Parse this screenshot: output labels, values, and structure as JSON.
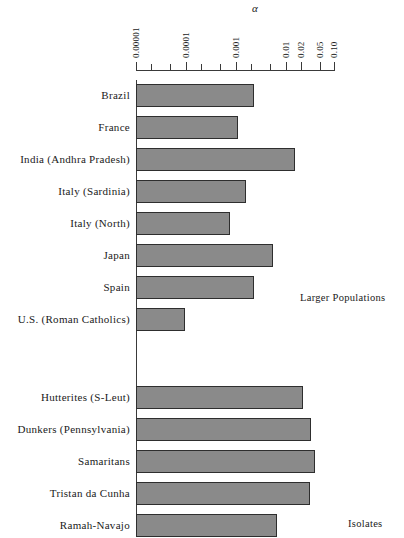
{
  "chart_data": {
    "type": "bar",
    "orientation": "horizontal",
    "title": "",
    "xlabel": "α",
    "ylabel": "",
    "xscale": "log",
    "xlim": [
      1e-05,
      0.1
    ],
    "grid": false,
    "legend_position": "none",
    "axis_symbol": "α",
    "tick_labels": [
      "0.00001",
      "0.0001",
      "0.001",
      "0.01",
      "0.02",
      "0.05",
      "0.10"
    ],
    "tick_values": [
      1e-05,
      0.0001,
      0.001,
      0.01,
      0.02,
      0.05,
      0.1
    ],
    "minor_tick_values": [
      2e-05,
      5e-05,
      0.0002,
      0.0005,
      0.002,
      0.005
    ],
    "categories": [
      "Brazil",
      "France",
      "India (Andhra Pradesh)",
      "Italy (Sardinia)",
      "Italy (North)",
      "Japan",
      "Spain",
      "U.S. (Roman Catholics)",
      "Hutterites (S-Leut)",
      "Dunkers (Pennsylvania)",
      "Samaritans",
      "Tristan da Cunha",
      "Ramah-Navajo"
    ],
    "values": [
      0.0023,
      0.0011,
      0.015,
      0.0016,
      0.00076,
      0.0055,
      0.0023,
      0.0001,
      0.022,
      0.032,
      0.038,
      0.03,
      0.0066
    ],
    "groups": [
      {
        "label": "Larger Populations",
        "categories": [
          "Brazil",
          "France",
          "India (Andhra Pradesh)",
          "Italy (Sardinia)",
          "Italy (North)",
          "Japan",
          "Spain",
          "U.S. (Roman Catholics)"
        ]
      },
      {
        "label": "Isolates",
        "categories": [
          "Hutterites (S-Leut)",
          "Dunkers (Pennsylvania)",
          "Samaritans",
          "Tristan da Cunha",
          "Ramah-Navajo"
        ]
      }
    ],
    "colors": {
      "bar_fill": "#8a8a8a",
      "bar_stroke": "#2e2e2e",
      "axis": "#3a3a3a",
      "text": "#1a1a1a",
      "background": "#ffffff"
    }
  },
  "rows": [
    {
      "label": "Brazil",
      "value": 0.0023,
      "bar_px": 118
    },
    {
      "label": "France",
      "value": 0.0011,
      "bar_px": 102
    },
    {
      "label": "India (Andhra Pradesh)",
      "value": 0.015,
      "bar_px": 159
    },
    {
      "label": "Italy (Sardinia)",
      "value": 0.0016,
      "bar_px": 110
    },
    {
      "label": "Italy (North)",
      "value": 0.00076,
      "bar_px": 94
    },
    {
      "label": "Japan",
      "value": 0.0055,
      "bar_px": 137
    },
    {
      "label": "Spain",
      "value": 0.0023,
      "bar_px": 118
    },
    {
      "label": "U.S. (Roman Catholics)",
      "value": 0.0001,
      "bar_px": 49
    },
    {
      "label": "Hutterites (S-Leut)",
      "value": 0.022,
      "bar_px": 167
    },
    {
      "label": "Dunkers (Pennsylvania)",
      "value": 0.032,
      "bar_px": 175
    },
    {
      "label": "Samaritans",
      "value": 0.038,
      "bar_px": 179
    },
    {
      "label": "Tristan da Cunha",
      "value": 0.03,
      "bar_px": 174
    },
    {
      "label": "Ramah-Navajo",
      "value": 0.0066,
      "bar_px": 141
    }
  ],
  "ticks": [
    {
      "label": "0.00001",
      "x": 136,
      "major": true
    },
    {
      "label": "",
      "x": 151,
      "major": false
    },
    {
      "label": "",
      "x": 170,
      "major": false
    },
    {
      "label": "0.0001",
      "x": 186,
      "major": true
    },
    {
      "label": "",
      "x": 201,
      "major": false
    },
    {
      "label": "",
      "x": 220,
      "major": false
    },
    {
      "label": "0.001",
      "x": 236,
      "major": true
    },
    {
      "label": "",
      "x": 251,
      "major": false
    },
    {
      "label": "",
      "x": 270,
      "major": false
    },
    {
      "label": "0.01",
      "x": 286,
      "major": true
    },
    {
      "label": "0.02",
      "x": 301,
      "major": true
    },
    {
      "label": "0.05",
      "x": 320,
      "major": true
    },
    {
      "label": "0.10",
      "x": 334,
      "major": true
    }
  ],
  "groups": {
    "larger_populations": "Larger Populations",
    "isolates": "Isolates"
  },
  "axis": {
    "symbol": "α"
  }
}
